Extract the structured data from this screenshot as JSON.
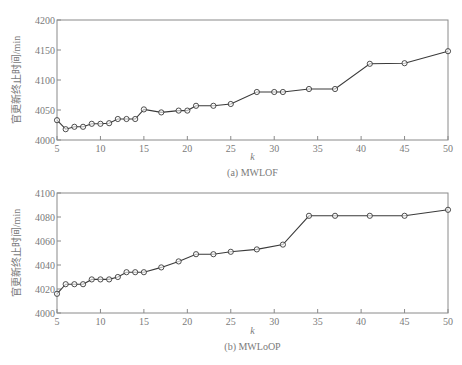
{
  "chart_data": [
    {
      "type": "line",
      "title": "(a) MWLOF",
      "xlabel": "k",
      "ylabel": "官更新终止时间/min",
      "xlim": [
        5,
        50
      ],
      "ylim": [
        4000,
        4200
      ],
      "xticks": [
        5,
        10,
        15,
        20,
        25,
        30,
        35,
        40,
        45,
        50
      ],
      "yticks": [
        4000,
        4050,
        4100,
        4150,
        4200
      ],
      "grid": false,
      "marker": "circle",
      "series": [
        {
          "name": "MWLOF",
          "x": [
            5,
            6,
            7,
            8,
            9,
            10,
            11,
            12,
            13,
            14,
            15,
            17,
            19,
            20,
            21,
            23,
            25,
            28,
            30,
            31,
            34,
            37,
            41,
            45,
            50
          ],
          "y": [
            4033,
            4018,
            4022,
            4022,
            4027,
            4027,
            4028,
            4035,
            4035,
            4035,
            4051,
            4046,
            4049,
            4049,
            4057,
            4057,
            4060,
            4080,
            4080,
            4080,
            4085,
            4085,
            4127,
            4128,
            4148
          ]
        }
      ]
    },
    {
      "type": "line",
      "title": "(b) MWLoOP",
      "xlabel": "k",
      "ylabel": "官更新终止时间/min",
      "xlim": [
        5,
        50
      ],
      "ylim": [
        4000,
        4100
      ],
      "xticks": [
        5,
        10,
        15,
        20,
        25,
        30,
        35,
        40,
        45,
        50
      ],
      "yticks": [
        4000,
        4020,
        4040,
        4060,
        4080,
        4100
      ],
      "grid": false,
      "marker": "circle",
      "series": [
        {
          "name": "MWLoOP",
          "x": [
            5,
            6,
            7,
            8,
            9,
            10,
            11,
            12,
            13,
            14,
            15,
            17,
            19,
            21,
            23,
            25,
            28,
            31,
            34,
            37,
            41,
            45,
            50
          ],
          "y": [
            4016,
            4024,
            4024,
            4024,
            4028,
            4028,
            4028,
            4030,
            4034,
            4034,
            4034,
            4038,
            4043,
            4049,
            4049,
            4051,
            4053,
            4057,
            4081,
            4081,
            4081,
            4081,
            4086
          ]
        }
      ]
    }
  ]
}
